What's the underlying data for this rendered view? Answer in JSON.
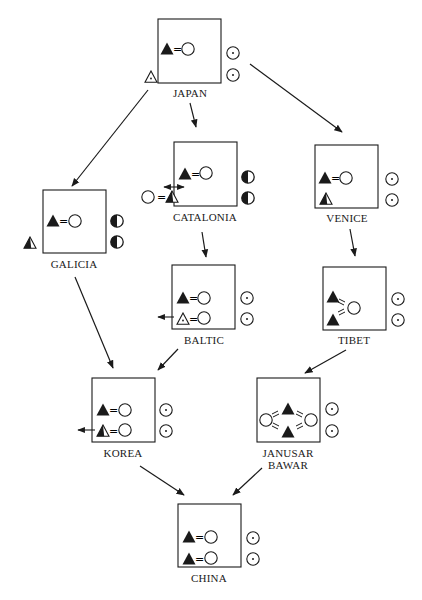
{
  "diagram": {
    "colors": {
      "ink": "#1a1a1a",
      "background": "#ffffff"
    },
    "nodes": [
      {
        "id": "japan",
        "label": "JAPAN"
      },
      {
        "id": "catalonia",
        "label": "CATALONIA"
      },
      {
        "id": "venice",
        "label": "VENICE"
      },
      {
        "id": "galicia",
        "label": "GALICIA"
      },
      {
        "id": "baltic",
        "label": "BALTIC"
      },
      {
        "id": "tibet",
        "label": "TIBET"
      },
      {
        "id": "korea",
        "label": "KOREA"
      },
      {
        "id": "janusar_bawar",
        "label": "JANUSAR\nBAWAR"
      },
      {
        "id": "china",
        "label": "CHINA"
      }
    ],
    "edges": [
      {
        "from": "japan",
        "to": "galicia"
      },
      {
        "from": "japan",
        "to": "catalonia"
      },
      {
        "from": "japan",
        "to": "venice"
      },
      {
        "from": "catalonia",
        "to": "baltic"
      },
      {
        "from": "venice",
        "to": "tibet"
      },
      {
        "from": "galicia",
        "to": "korea"
      },
      {
        "from": "baltic",
        "to": "korea"
      },
      {
        "from": "tibet",
        "to": "janusar_bawar"
      },
      {
        "from": "korea",
        "to": "china"
      },
      {
        "from": "janusar_bawar",
        "to": "china"
      }
    ],
    "symbol_legend": {
      "filled-triangle": "filled triangle",
      "open-triangle-dot": "open triangle with dot",
      "half-filled-triangle": "half-filled triangle",
      "open-circle": "open circle",
      "dot-circle": "circle with center dot",
      "half-circle": "half-filled circle",
      "equals": "="
    }
  }
}
